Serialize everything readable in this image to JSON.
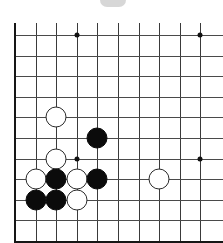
{
  "diagram": {
    "board_type": "go-board",
    "visible_columns": 10,
    "visible_rows": 10,
    "grid_origin_x": 15,
    "grid_origin_y": 35,
    "grid_spacing": 20.6,
    "line_color": "#3a3a3a",
    "edge_color": "#161616",
    "background_color": "#ffffff",
    "stone_radius": 10.5,
    "artifact": {
      "label": "top-edge-grey-artifact",
      "color": "#c9c9c9"
    },
    "star_points": [
      {
        "col": 3,
        "row": 0
      },
      {
        "col": 9,
        "row": 0
      },
      {
        "col": 3,
        "row": 6
      },
      {
        "col": 9,
        "row": 6
      }
    ],
    "stones": [
      {
        "color": "white",
        "col": 2,
        "row": 4
      },
      {
        "color": "black",
        "col": 4,
        "row": 5
      },
      {
        "color": "white",
        "col": 2,
        "row": 6
      },
      {
        "color": "white",
        "col": 1,
        "row": 7
      },
      {
        "color": "black",
        "col": 2,
        "row": 7
      },
      {
        "color": "white",
        "col": 3,
        "row": 7
      },
      {
        "color": "black",
        "col": 4,
        "row": 7
      },
      {
        "color": "white",
        "col": 7,
        "row": 7
      },
      {
        "color": "black",
        "col": 1,
        "row": 8
      },
      {
        "color": "black",
        "col": 2,
        "row": 8
      },
      {
        "color": "white",
        "col": 3,
        "row": 8
      }
    ]
  },
  "chart_data": {
    "type": "table",
    "xlabel": "board column",
    "ylabel": "board row",
    "columns": [
      "color",
      "col",
      "row"
    ],
    "rows": [
      [
        "white",
        2,
        4
      ],
      [
        "black",
        4,
        5
      ],
      [
        "white",
        2,
        6
      ],
      [
        "white",
        1,
        7
      ],
      [
        "black",
        2,
        7
      ],
      [
        "white",
        3,
        7
      ],
      [
        "black",
        4,
        7
      ],
      [
        "white",
        7,
        7
      ],
      [
        "black",
        1,
        8
      ],
      [
        "black",
        2,
        8
      ],
      [
        "white",
        3,
        8
      ]
    ],
    "counts": {
      "black": 5,
      "white": 6,
      "total": 11
    }
  }
}
